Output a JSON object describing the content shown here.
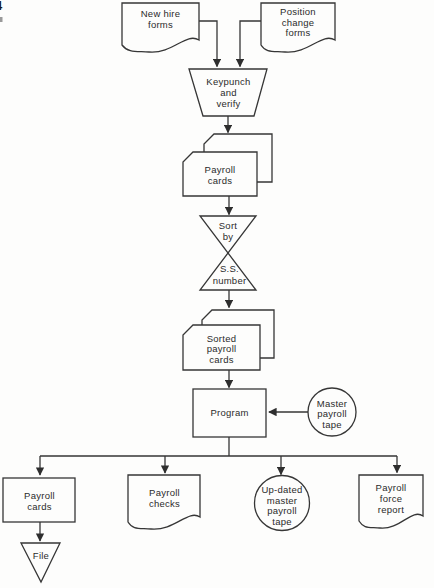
{
  "page": {
    "corner_fragment": "4"
  },
  "diagram": {
    "type": "flowchart",
    "line_color": "#363636",
    "background_color": "#fdfdfc",
    "text_color": "#2b2b2b",
    "nodes": {
      "new_hire_forms": {
        "shape": "document",
        "lines": [
          "New hire",
          "forms"
        ]
      },
      "position_change_forms": {
        "shape": "document",
        "lines": [
          "Position",
          "change",
          "forms"
        ]
      },
      "keypunch": {
        "shape": "manual-operation-trapezoid",
        "lines": [
          "Keypunch",
          "and",
          "verify"
        ]
      },
      "payroll_cards": {
        "shape": "punched-card-stack",
        "lines": [
          "Payroll",
          "cards"
        ]
      },
      "sort": {
        "shape": "sort-hourglass",
        "lines_top": [
          "Sort",
          "by"
        ],
        "lines_bottom": [
          "S.S.",
          "number"
        ]
      },
      "sorted_payroll_cards": {
        "shape": "punched-card-stack",
        "lines": [
          "Sorted",
          "payroll",
          "cards"
        ]
      },
      "program": {
        "shape": "process-rectangle",
        "lines": [
          "Program"
        ]
      },
      "master_payroll_tape": {
        "shape": "magnetic-tape-circle",
        "lines": [
          "Master",
          "payroll",
          "tape"
        ]
      },
      "payroll_cards_output": {
        "shape": "rectangle",
        "lines": [
          "Payroll",
          "cards"
        ]
      },
      "payroll_checks": {
        "shape": "document",
        "lines": [
          "Payroll",
          "checks"
        ]
      },
      "updated_master_payroll_tape": {
        "shape": "magnetic-tape-circle",
        "lines": [
          "Up-dated",
          "master",
          "payroll",
          "tape"
        ]
      },
      "payroll_force_report": {
        "shape": "document",
        "lines": [
          "Payroll",
          "force",
          "report"
        ]
      },
      "file": {
        "shape": "offline-storage-triangle",
        "lines": [
          "File"
        ]
      }
    },
    "edges": [
      {
        "from": "new_hire_forms",
        "to": "keypunch"
      },
      {
        "from": "position_change_forms",
        "to": "keypunch"
      },
      {
        "from": "keypunch",
        "to": "payroll_cards"
      },
      {
        "from": "payroll_cards",
        "to": "sort"
      },
      {
        "from": "sort",
        "to": "sorted_payroll_cards"
      },
      {
        "from": "sorted_payroll_cards",
        "to": "program"
      },
      {
        "from": "master_payroll_tape",
        "to": "program"
      },
      {
        "from": "program",
        "to": "payroll_cards_output"
      },
      {
        "from": "program",
        "to": "payroll_checks"
      },
      {
        "from": "program",
        "to": "updated_master_payroll_tape"
      },
      {
        "from": "program",
        "to": "payroll_force_report"
      },
      {
        "from": "payroll_cards_output",
        "to": "file"
      }
    ]
  }
}
